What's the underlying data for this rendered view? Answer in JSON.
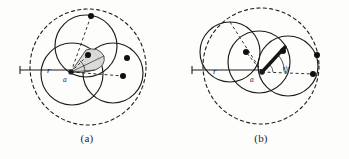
{
  "document": {
    "type": "scanned-figure-pair",
    "background_color": "#fdfdfc",
    "ink_color": "#1d1d1d"
  },
  "figures": [
    {
      "id": "a",
      "caption": "(a)",
      "outer_circle": {
        "style": "dashed",
        "cx": 88,
        "cy": 67,
        "r": 58
      },
      "solid_circles": [
        {
          "cx": 86,
          "cy": 46,
          "r": 31
        },
        {
          "cx": 72,
          "cy": 74,
          "r": 31
        },
        {
          "cx": 113,
          "cy": 73,
          "r": 30
        }
      ],
      "vertex": {
        "x": 71,
        "y": 72,
        "label": "a"
      },
      "labels": [
        {
          "text": "r",
          "x": 50,
          "y": 70
        },
        {
          "text": "a",
          "x": 66,
          "y": 80
        }
      ],
      "dots": [
        {
          "x": 91,
          "y": 16
        },
        {
          "x": 88,
          "y": 55
        },
        {
          "x": 127,
          "y": 58
        },
        {
          "x": 123,
          "y": 76
        }
      ],
      "shaded_region": {
        "fill": "#d8d8d6",
        "stroke": "#2a2a2a"
      },
      "horizontal_tick": {
        "x1": 20,
        "x2": 71,
        "y": 70
      },
      "dashed_radii": [
        {
          "to_x": 91,
          "to_y": 16
        },
        {
          "to_x": 123,
          "to_y": 76
        }
      ]
    },
    {
      "id": "b",
      "caption": "(b)",
      "outer_circle": {
        "style": "dashed",
        "cx": 87,
        "cy": 66,
        "r": 58
      },
      "solid_circles": [
        {
          "cx": 56,
          "cy": 52,
          "r": 30
        },
        {
          "cx": 85,
          "cy": 62,
          "r": 31
        },
        {
          "cx": 114,
          "cy": 66,
          "r": 30
        }
      ],
      "vertex": {
        "x": 88,
        "y": 72,
        "label": "a"
      },
      "labels": [
        {
          "text": "r",
          "x": 42,
          "y": 71
        },
        {
          "text": "a",
          "x": 79,
          "y": 80
        },
        {
          "text": "ψ",
          "x": 112,
          "y": 69
        }
      ],
      "dots": [
        {
          "x": 72,
          "y": 52
        },
        {
          "x": 109,
          "y": 51
        },
        {
          "x": 143,
          "y": 55
        },
        {
          "x": 139,
          "y": 74
        }
      ],
      "thick_segment": {
        "x1": 88,
        "y1": 72,
        "x2": 110,
        "y2": 48
      },
      "angle_arc": {
        "label": "ψ",
        "radius": 22
      },
      "horizontal_tick": {
        "x1": 18,
        "x2": 88,
        "y": 70
      },
      "dashed_radii": [
        {
          "to_x": 56,
          "to_y": 22
        },
        {
          "to_x": 139,
          "to_y": 74
        },
        {
          "to_x": 72,
          "to_y": 52
        }
      ]
    }
  ]
}
